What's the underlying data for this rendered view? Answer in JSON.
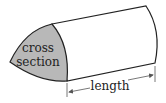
{
  "diagram": {
    "labels": {
      "cross_section_line1": "cross",
      "cross_section_line2": "section",
      "length": "length"
    },
    "colors": {
      "cross_section_fill": "#b8b8b8",
      "stroke": "#222222",
      "body_fill": "#ffffff",
      "arrow": "#555555"
    }
  }
}
